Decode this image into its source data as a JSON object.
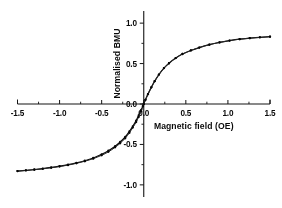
{
  "figure": {
    "background_color": "#ffffff",
    "ink_color": "#111111"
  },
  "chart_data": {
    "type": "line",
    "title": "",
    "xlabel": "Magnetic field (OE)",
    "ylabel": "Normalised BMU",
    "xlim": [
      -1.5,
      1.5
    ],
    "ylim": [
      -1.15,
      1.15
    ],
    "xticks": [
      -1.5,
      -1.0,
      -0.5,
      0.0,
      0.5,
      1.0,
      1.5
    ],
    "xticklabels": [
      "-1.5",
      "-1.0",
      "-0.5",
      "0.0",
      "0.5",
      "1.0",
      "1.5"
    ],
    "yticks": [
      1.0,
      0.5,
      0.0,
      -0.5,
      -1.0
    ],
    "yticklabels": [
      "1.0",
      "0.5",
      "0.0",
      "-0.5",
      "-1.0"
    ],
    "x_minor_ticks": [
      -1.25,
      -0.75,
      -0.25,
      0.25,
      0.75,
      1.25
    ],
    "y_minor_ticks": [
      0.75,
      0.25,
      -0.25,
      -0.75
    ],
    "grid": false,
    "legend": null,
    "axes_style": "crossed-at-origin",
    "series": [
      {
        "name": "branch-increasing",
        "marker": "filled-circle",
        "x": [
          -1.5,
          -1.4,
          -1.3,
          -1.2,
          -1.1,
          -1.0,
          -0.9,
          -0.8,
          -0.7,
          -0.6,
          -0.5,
          -0.42,
          -0.34,
          -0.28,
          -0.22,
          -0.17,
          -0.13,
          -0.09,
          -0.06,
          -0.03,
          -0.01,
          0.0,
          0.02,
          0.05,
          0.09,
          0.13,
          0.18,
          0.24,
          0.3,
          0.38,
          0.46,
          0.56,
          0.66,
          0.78,
          0.9,
          1.02,
          1.14,
          1.26,
          1.38,
          1.5
        ],
        "y": [
          -0.83,
          -0.82,
          -0.81,
          -0.798,
          -0.784,
          -0.768,
          -0.75,
          -0.728,
          -0.702,
          -0.668,
          -0.622,
          -0.578,
          -0.522,
          -0.47,
          -0.408,
          -0.338,
          -0.276,
          -0.206,
          -0.14,
          -0.072,
          -0.024,
          0.004,
          0.052,
          0.122,
          0.206,
          0.282,
          0.364,
          0.444,
          0.504,
          0.568,
          0.618,
          0.662,
          0.698,
          0.734,
          0.762,
          0.784,
          0.802,
          0.814,
          0.824,
          0.832
        ]
      },
      {
        "name": "branch-decreasing",
        "marker": "filled-circle",
        "x": [
          1.5,
          1.38,
          1.26,
          1.14,
          1.02,
          0.9,
          0.78,
          0.66,
          0.56,
          0.46,
          0.38,
          0.3,
          0.24,
          0.18,
          0.13,
          0.09,
          0.05,
          0.02,
          0.0,
          -0.01,
          -0.03,
          -0.06,
          -0.09,
          -0.13,
          -0.17,
          -0.22,
          -0.28,
          -0.34,
          -0.42,
          -0.5,
          -0.6,
          -0.7,
          -0.8,
          -0.9,
          -1.0,
          -1.1,
          -1.2,
          -1.3,
          -1.4,
          -1.5
        ],
        "y": [
          0.832,
          0.824,
          0.814,
          0.802,
          0.784,
          0.762,
          0.734,
          0.698,
          0.662,
          0.618,
          0.568,
          0.504,
          0.444,
          0.364,
          0.282,
          0.206,
          0.122,
          0.052,
          -0.004,
          -0.03,
          -0.09,
          -0.16,
          -0.224,
          -0.292,
          -0.356,
          -0.424,
          -0.486,
          -0.536,
          -0.592,
          -0.634,
          -0.676,
          -0.708,
          -0.734,
          -0.756,
          -0.774,
          -0.789,
          -0.802,
          -0.813,
          -0.822,
          -0.83
        ]
      }
    ]
  }
}
